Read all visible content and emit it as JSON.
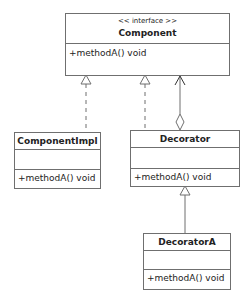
{
  "diagram": {
    "type": "UML class diagram (Decorator pattern)",
    "classes": [
      {
        "id": "component",
        "stereotype": "<< interface >>",
        "name": "Component",
        "attributes": [],
        "operations": [
          "+methodA() void"
        ]
      },
      {
        "id": "componentimpl",
        "name": "ComponentImpl",
        "attributes": [],
        "operations": [
          "+methodA() void"
        ]
      },
      {
        "id": "decorator",
        "name": "Decorator",
        "attributes": [],
        "operations": [
          "+methodA() void"
        ]
      },
      {
        "id": "decoratora",
        "name": "DecoratorA",
        "attributes": [],
        "operations": [
          "+methodA() void"
        ]
      }
    ],
    "relations": [
      {
        "from": "ComponentImpl",
        "to": "Component",
        "kind": "realization"
      },
      {
        "from": "Decorator",
        "to": "Component",
        "kind": "realization"
      },
      {
        "from": "Decorator",
        "to": "Component",
        "kind": "aggregation"
      },
      {
        "from": "DecoratorA",
        "to": "Decorator",
        "kind": "generalization"
      }
    ],
    "colors": {
      "line": "#6f6f6f",
      "background": "#ffffff",
      "text": "#222222"
    }
  }
}
